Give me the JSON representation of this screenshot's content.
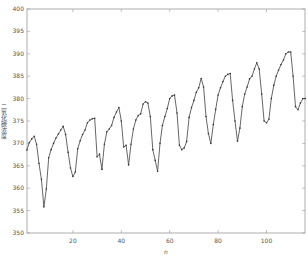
{
  "chart_data": {
    "type": "line",
    "title": "",
    "xlabel": "n",
    "ylabel": "二氧化碳浓度",
    "xlim": [
      0,
      116
    ],
    "ylim": [
      350,
      400
    ],
    "xticks": [
      20,
      40,
      60,
      80,
      100
    ],
    "yticks": [
      350,
      355,
      360,
      365,
      370,
      375,
      380,
      385,
      390,
      395,
      400
    ],
    "grid": false,
    "legend": null,
    "colors": {
      "line": "#555555",
      "marker": "#333333",
      "axis": "#999999"
    },
    "series": [
      {
        "name": "CO2",
        "x": [
          1,
          2,
          3,
          4,
          5,
          6,
          7,
          8,
          9,
          10,
          11,
          12,
          13,
          14,
          15,
          16,
          17,
          18,
          19,
          20,
          21,
          22,
          23,
          24,
          25,
          26,
          27,
          28,
          29,
          30,
          31,
          32,
          33,
          34,
          35,
          36,
          37,
          38,
          39,
          40,
          41,
          42,
          43,
          44,
          45,
          46,
          47,
          48,
          49,
          50,
          51,
          52,
          53,
          54,
          55,
          56,
          57,
          58,
          59,
          60,
          61,
          62,
          63,
          64,
          65,
          66,
          67,
          68,
          69,
          70,
          71,
          72,
          73,
          74,
          75,
          76,
          77,
          78,
          79,
          80,
          81,
          82,
          83,
          84,
          85,
          86,
          87,
          88,
          89,
          90,
          91,
          92,
          93,
          94,
          95,
          96,
          97,
          98,
          99,
          100,
          101,
          102,
          103,
          104,
          105,
          106,
          107,
          108,
          109,
          110,
          111,
          112,
          113,
          114,
          115,
          116
        ],
        "values": [
          368.5,
          370.2,
          371.0,
          371.6,
          369.8,
          365.5,
          362.0,
          355.8,
          359.8,
          366.8,
          368.6,
          370.0,
          371.2,
          372.1,
          373.0,
          373.8,
          372.0,
          368.0,
          364.5,
          362.6,
          363.6,
          368.8,
          370.6,
          372.0,
          373.0,
          374.6,
          375.2,
          375.5,
          375.6,
          367.0,
          367.6,
          364.2,
          369.8,
          372.6,
          373.2,
          374.0,
          375.8,
          377.0,
          378.0,
          375.0,
          369.2,
          369.6,
          365.2,
          369.8,
          373.2,
          375.2,
          376.2,
          376.6,
          378.8,
          379.3,
          379.0,
          376.0,
          368.6,
          366.2,
          363.8,
          370.0,
          374.0,
          376.0,
          377.8,
          380.0,
          380.6,
          380.8,
          376.8,
          369.6,
          368.6,
          369.0,
          370.4,
          375.8,
          378.0,
          379.6,
          381.4,
          382.4,
          384.5,
          382.6,
          376.0,
          372.2,
          370.0,
          374.2,
          377.6,
          380.8,
          382.4,
          383.8,
          385.0,
          385.4,
          385.6,
          379.6,
          375.0,
          370.5,
          373.4,
          378.2,
          381.0,
          382.6,
          384.4,
          385.0,
          386.6,
          388.0,
          386.6,
          381.0,
          375.0,
          374.6,
          375.4,
          380.0,
          383.0,
          385.0,
          386.4,
          387.6,
          388.6,
          390.0,
          390.4,
          390.4,
          385.0,
          378.2,
          377.5,
          379.0,
          380.0,
          380.0
        ]
      }
    ]
  }
}
